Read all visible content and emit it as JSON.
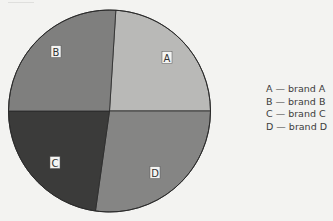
{
  "chart_data": {
    "type": "pie",
    "title": "",
    "categories": [
      "A",
      "B",
      "C",
      "D"
    ],
    "values": [
      24,
      26,
      23,
      27
    ],
    "value_note": "approximate share (%) estimated from slice angles; no numeric labels shown",
    "slices": [
      {
        "label": "A",
        "name": "brand A",
        "value": 24,
        "start_deg": 3.6,
        "end_deg": 90,
        "color": "#b9b9b7",
        "label_pos": [
          167,
          58
        ]
      },
      {
        "label": "D",
        "name": "brand D",
        "value": 27,
        "start_deg": 90,
        "end_deg": 188,
        "color": "#858584",
        "label_pos": [
          155,
          173
        ]
      },
      {
        "label": "C",
        "name": "brand C",
        "value": 23,
        "start_deg": 188,
        "end_deg": 270,
        "color": "#3b3b3a",
        "label_pos": [
          55,
          163
        ]
      },
      {
        "label": "B",
        "name": "brand B",
        "value": 26,
        "start_deg": 270,
        "end_deg": 363.6,
        "color": "#7f7f7e",
        "label_pos": [
          56,
          52
        ]
      }
    ],
    "legend": {
      "position": "right",
      "entries": [
        {
          "key": "A",
          "text": "A — brand A"
        },
        {
          "key": "B",
          "text": "B  — brand B"
        },
        {
          "key": "C",
          "text": "C — brand C"
        },
        {
          "key": "D",
          "text": "D — brand D"
        }
      ]
    },
    "geometry": {
      "cx": 109.5,
      "cy": 111,
      "r": 101
    }
  }
}
